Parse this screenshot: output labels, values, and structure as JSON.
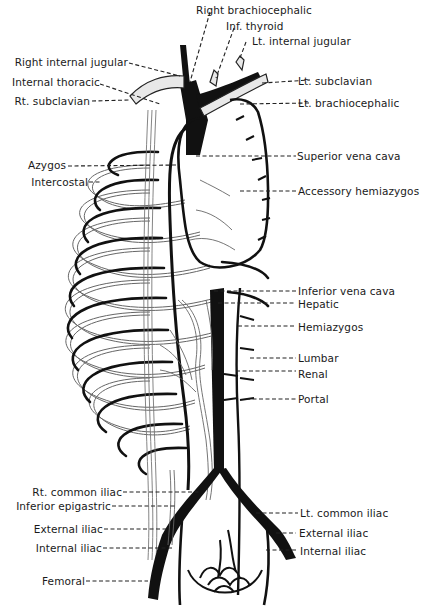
{
  "figure": {
    "colors": {
      "vein_fill": "#111111",
      "vessel_outline": "#555555",
      "leader_line": "#222222",
      "background": "#ffffff"
    }
  },
  "labels": {
    "left": [
      {
        "id": "right-internal-jugular",
        "text": "Right internal jugular"
      },
      {
        "id": "internal-thoracic",
        "text": "Internal thoracic"
      },
      {
        "id": "rt-subclavian",
        "text": "Rt. subclavian"
      },
      {
        "id": "azygos",
        "text": "Azygos"
      },
      {
        "id": "intercostal",
        "text": "Intercostal"
      },
      {
        "id": "rt-common-iliac",
        "text": "Rt. common iliac"
      },
      {
        "id": "inferior-epigastric",
        "text": "Inferior epigastric"
      },
      {
        "id": "external-iliac-left",
        "text": "External iliac"
      },
      {
        "id": "internal-iliac-left",
        "text": "Internal iliac"
      },
      {
        "id": "femoral",
        "text": "Femoral"
      }
    ],
    "top": [
      {
        "id": "right-brachiocephalic",
        "text": "Right brachiocephalic"
      },
      {
        "id": "inf-thyroid",
        "text": "Inf. thyroid"
      },
      {
        "id": "lt-internal-jugular",
        "text": "Lt. internal jugular"
      }
    ],
    "right": [
      {
        "id": "lt-subclavian",
        "text": "Lt. subclavian"
      },
      {
        "id": "lt-brachiocephalic",
        "text": "Lt. brachiocephalic"
      },
      {
        "id": "superior-vena-cava",
        "text": "Superior vena cava"
      },
      {
        "id": "accessory-hemiazygos",
        "text": "Accessory hemiazygos"
      },
      {
        "id": "inferior-vena-cava",
        "text": "Inferior vena cava"
      },
      {
        "id": "hepatic",
        "text": "Hepatic"
      },
      {
        "id": "hemiazygos",
        "text": "Hemiazygos"
      },
      {
        "id": "lumbar",
        "text": "Lumbar"
      },
      {
        "id": "renal",
        "text": "Renal"
      },
      {
        "id": "portal",
        "text": "Portal"
      },
      {
        "id": "lt-common-iliac",
        "text": "Lt. common iliac"
      },
      {
        "id": "external-iliac-right",
        "text": "External iliac"
      },
      {
        "id": "internal-iliac-right",
        "text": "Internal iliac"
      }
    ]
  }
}
